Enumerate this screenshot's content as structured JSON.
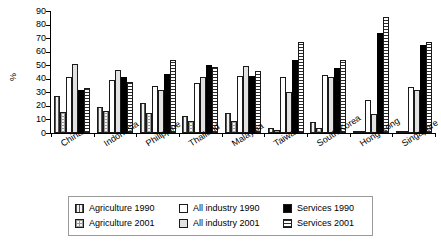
{
  "chart_data": {
    "type": "bar",
    "title": "",
    "xlabel": "",
    "ylabel": "%",
    "ylim": [
      0,
      90
    ],
    "yticks": [
      0,
      10,
      20,
      30,
      40,
      50,
      60,
      70,
      80,
      90
    ],
    "grid": false,
    "legend_position": "bottom",
    "categories": [
      "China",
      "Indonesia",
      "Philippine",
      "Thailand",
      "Malaysia",
      "Taiwan",
      "South Korea",
      "Hong Kong",
      "Singapore"
    ],
    "series": [
      {
        "name": "Agriculture 1990",
        "pattern": "vertical-lines",
        "values": [
          27,
          19.5,
          22,
          12.5,
          15,
          4,
          8,
          0.3,
          0.3
        ]
      },
      {
        "name": "Agriculture 2001",
        "pattern": "checkered",
        "values": [
          15.5,
          16,
          15,
          8.5,
          8.5,
          2,
          4,
          0.1,
          0.1
        ]
      },
      {
        "name": "All industry 1990",
        "pattern": "white",
        "values": [
          41.5,
          39,
          34.5,
          37,
          42,
          41,
          42.5,
          24.5,
          34
        ]
      },
      {
        "name": "All industry 2001",
        "pattern": "light-gray",
        "values": [
          51,
          46.5,
          31.5,
          41.5,
          49.5,
          30.5,
          41,
          14,
          31.5
        ]
      },
      {
        "name": "Services 1990",
        "pattern": "solid-black",
        "values": [
          31.5,
          41.5,
          43.5,
          50,
          42,
          54,
          48,
          74,
          65
        ]
      },
      {
        "name": "Services 2001",
        "pattern": "horizontal-lines",
        "values": [
          33.5,
          37.5,
          53.5,
          49,
          45.5,
          67,
          53.5,
          85.5,
          67.5
        ]
      }
    ],
    "colors": {
      "bar_outline": "#1a1a1a",
      "services_1990": "#000000",
      "all_industry_2001": "#e2e2e2",
      "all_industry_1990": "#ffffff",
      "axis": "#000000"
    }
  },
  "legend": {
    "items": [
      {
        "label": "Agriculture 1990",
        "swatch": "p-agri90"
      },
      {
        "label": "All industry 1990",
        "swatch": "p-ind90"
      },
      {
        "label": "Services 1990",
        "swatch": "p-srv90"
      },
      {
        "label": "Agriculture 2001",
        "swatch": "p-agri01"
      },
      {
        "label": "All industry 2001",
        "swatch": "p-ind01"
      },
      {
        "label": "Services 2001",
        "swatch": "p-srv01"
      }
    ]
  }
}
